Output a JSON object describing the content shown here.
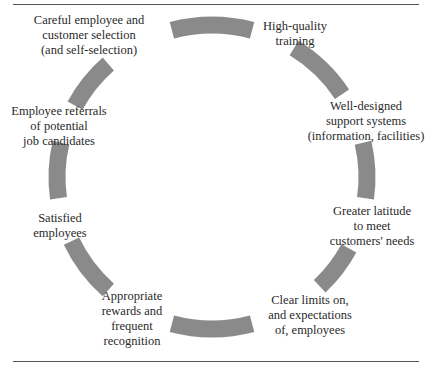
{
  "diagram": {
    "type": "cycle",
    "arc_color": "#8a8a8a",
    "rule_color": "#555555",
    "nodes": [
      {
        "id": "selection",
        "text": "Careful employee and\ncustomer selection\n(and self-selection)"
      },
      {
        "id": "training",
        "text": "High-quality\ntraining"
      },
      {
        "id": "support",
        "text": "Well-designed\nsupport systems\n(information, facilities)"
      },
      {
        "id": "latitude",
        "text": "Greater latitude\nto meet\ncustomers' needs"
      },
      {
        "id": "limits",
        "text": "Clear limits on,\nand expectations\nof, employees"
      },
      {
        "id": "rewards",
        "text": "Appropriate\nrewards and\nfrequent\nrecognition"
      },
      {
        "id": "satisfied",
        "text": "Satisfied\nemployees"
      },
      {
        "id": "referrals",
        "text": "Employee referrals\nof potential\njob candidates"
      }
    ]
  }
}
